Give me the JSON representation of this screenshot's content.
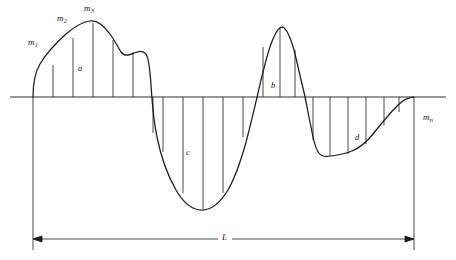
{
  "figure": {
    "type": "waveform-ordinate-diagram",
    "baseline_y": 97,
    "stroke_color": "#1a1a1a",
    "background_color": "#ffffff"
  },
  "ordinate_labels": [
    {
      "id": "m1",
      "text": "m",
      "sub": "1",
      "x": 28,
      "y": 38
    },
    {
      "id": "m2",
      "text": "m",
      "sub": "2",
      "x": 57,
      "y": 14
    },
    {
      "id": "m3",
      "text": "m",
      "sub": "3",
      "x": 84,
      "y": 4
    },
    {
      "id": "mn",
      "text": "m",
      "sub": "n",
      "x": 423,
      "y": 113
    }
  ],
  "region_labels": [
    {
      "id": "a",
      "text": "a",
      "x": 78,
      "y": 64
    },
    {
      "id": "b",
      "text": "b",
      "x": 271,
      "y": 81
    },
    {
      "id": "c",
      "text": "c",
      "x": 186,
      "y": 148
    },
    {
      "id": "d",
      "text": "d",
      "x": 355,
      "y": 133
    }
  ],
  "dimension": {
    "label": "L",
    "label_x": 224,
    "label_y": 234,
    "line_y": 239,
    "start_x": 33,
    "end_x": 414
  },
  "geometry": {
    "ordinate_spacing": 20,
    "ordinate_x_positions": [
      53,
      73,
      93,
      113,
      133,
      153,
      173,
      193,
      213,
      233,
      253,
      273,
      293,
      313,
      333,
      353,
      373,
      393
    ],
    "curve_start_x": 33,
    "curve_end_x": 414,
    "peak_a_x": 93,
    "peak_a_y": 22,
    "peak_b_x": 280,
    "peak_b_y": 27,
    "trough_c_x": 202,
    "trough_c_y": 210,
    "trough_d_x": 330,
    "trough_d_y": 156
  }
}
